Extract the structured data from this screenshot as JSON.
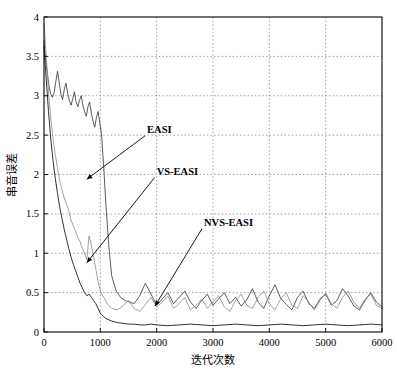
{
  "chart_data": {
    "type": "line",
    "title": "",
    "xlabel": "迭代次数",
    "ylabel": "串音误差",
    "xlim": [
      0,
      6000
    ],
    "ylim": [
      0,
      4
    ],
    "xticks": [
      0,
      1000,
      2000,
      3000,
      4000,
      5000,
      6000
    ],
    "xtick_labels": [
      "0",
      "1000",
      "2000",
      "3000",
      "4000",
      "5000",
      "6000"
    ],
    "yticks": [
      0,
      0.5,
      1,
      1.5,
      2,
      2.5,
      3,
      3.5,
      4
    ],
    "ytick_labels": [
      "0",
      "0.5",
      "1",
      "1.5",
      "2",
      "2.5",
      "3",
      "3.5",
      "4"
    ],
    "grid": true,
    "grid_style": "dotted",
    "legend": "annotations",
    "colors": {
      "easi": "#333333",
      "vs_easi": "#8a8a8a",
      "nvs_easi": "#1a1a1a",
      "grid": "#8a8a8a",
      "axis": "#000000"
    },
    "annotations": [
      {
        "label": "EASI",
        "text_x": 1830,
        "text_y": 2.53,
        "arrow_to_x": 760,
        "arrow_to_y": 1.94
      },
      {
        "label": "VS-EASI",
        "text_x": 2000,
        "text_y": 2.0,
        "arrow_to_x": 760,
        "arrow_to_y": 0.88
      },
      {
        "label": "NVS-EASI",
        "text_x": 2840,
        "text_y": 1.35,
        "arrow_to_x": 1970,
        "arrow_to_y": 0.33
      }
    ],
    "series": [
      {
        "name": "EASI",
        "color": "#333333",
        "description": "Noisy high-variance trace; starts near 3.7, oscillates around 3.0 until ~1000 iterations, then drops sharply and fluctuates around 0.3-0.5 thereafter.",
        "x": [
          0,
          30,
          60,
          90,
          120,
          150,
          180,
          210,
          240,
          270,
          300,
          330,
          360,
          390,
          420,
          450,
          480,
          510,
          540,
          570,
          600,
          630,
          660,
          690,
          720,
          750,
          780,
          810,
          840,
          870,
          900,
          930,
          960,
          990,
          1020,
          1060,
          1100,
          1150,
          1200,
          1280,
          1360,
          1440,
          1520,
          1600,
          1700,
          1800,
          1900,
          2000,
          2100,
          2200,
          2300,
          2400,
          2500,
          2600,
          2700,
          2800,
          2900,
          3000,
          3100,
          3200,
          3300,
          3400,
          3500,
          3600,
          3700,
          3800,
          3900,
          4000,
          4100,
          4200,
          4300,
          4400,
          4500,
          4600,
          4700,
          4800,
          4900,
          5000,
          5100,
          5200,
          5300,
          5400,
          5500,
          5600,
          5700,
          5800,
          5900,
          6000
        ],
        "y": [
          3.7,
          3.45,
          3.28,
          3.12,
          3.02,
          2.98,
          3.04,
          3.18,
          3.31,
          3.17,
          3.02,
          2.95,
          3.08,
          3.16,
          3.03,
          2.94,
          2.88,
          2.96,
          3.05,
          2.92,
          2.86,
          2.94,
          3.0,
          2.88,
          2.8,
          2.74,
          2.86,
          2.92,
          2.78,
          2.68,
          2.6,
          2.72,
          2.8,
          2.66,
          2.52,
          2.1,
          1.6,
          1.1,
          0.72,
          0.52,
          0.44,
          0.4,
          0.38,
          0.36,
          0.46,
          0.62,
          0.48,
          0.34,
          0.42,
          0.5,
          0.36,
          0.44,
          0.52,
          0.38,
          0.3,
          0.4,
          0.48,
          0.34,
          0.42,
          0.5,
          0.36,
          0.44,
          0.33,
          0.41,
          0.55,
          0.38,
          0.3,
          0.46,
          0.6,
          0.43,
          0.35,
          0.28,
          0.44,
          0.52,
          0.36,
          0.3,
          0.42,
          0.48,
          0.34,
          0.4,
          0.55,
          0.46,
          0.33,
          0.28,
          0.4,
          0.5,
          0.38,
          0.32
        ]
      },
      {
        "name": "VS-EASI",
        "color": "#8a8a8a",
        "description": "Gray trace; descends steadily from ~3.9 reaching ~1.0 by iteration 700 and ~0.3 by 1300, then fluctuates around 0.25-0.45.",
        "x": [
          0,
          40,
          80,
          120,
          160,
          200,
          240,
          280,
          320,
          360,
          400,
          440,
          480,
          520,
          560,
          600,
          640,
          680,
          720,
          760,
          800,
          840,
          880,
          920,
          960,
          1000,
          1060,
          1120,
          1200,
          1300,
          1400,
          1500,
          1600,
          1700,
          1800,
          1900,
          2000,
          2100,
          2200,
          2300,
          2400,
          2500,
          2600,
          2700,
          2800,
          2900,
          3000,
          3100,
          3200,
          3300,
          3400,
          3500,
          3600,
          3700,
          3800,
          3900,
          4000,
          4100,
          4200,
          4300,
          4400,
          4500,
          4600,
          4700,
          4800,
          4900,
          5000,
          5100,
          5200,
          5300,
          5400,
          5500,
          5600,
          5700,
          5800,
          5900,
          6000
        ],
        "y": [
          3.92,
          3.5,
          3.05,
          2.72,
          2.45,
          2.25,
          2.08,
          1.92,
          1.8,
          1.7,
          1.62,
          1.54,
          1.42,
          1.35,
          1.28,
          1.2,
          1.15,
          1.06,
          1.0,
          0.92,
          1.22,
          1.1,
          0.95,
          0.8,
          0.65,
          0.52,
          0.44,
          0.36,
          0.3,
          0.28,
          0.33,
          0.4,
          0.3,
          0.26,
          0.35,
          0.44,
          0.32,
          0.38,
          0.46,
          0.3,
          0.36,
          0.44,
          0.28,
          0.34,
          0.42,
          0.3,
          0.38,
          0.46,
          0.32,
          0.26,
          0.4,
          0.48,
          0.34,
          0.3,
          0.44,
          0.52,
          0.36,
          0.28,
          0.42,
          0.5,
          0.34,
          0.3,
          0.46,
          0.38,
          0.28,
          0.4,
          0.5,
          0.36,
          0.3,
          0.44,
          0.52,
          0.38,
          0.3,
          0.42,
          0.48,
          0.34,
          0.3
        ]
      },
      {
        "name": "NVS-EASI",
        "color": "#1a1a1a",
        "description": "Fastest converging trace; falls from ~3.6 to below 0.2 by iteration 1100 and stays flat near 0.08-0.12 for the remainder.",
        "x": [
          0,
          40,
          80,
          120,
          160,
          200,
          240,
          280,
          320,
          360,
          400,
          440,
          480,
          520,
          560,
          600,
          640,
          680,
          720,
          760,
          800,
          840,
          880,
          920,
          960,
          1000,
          1050,
          1100,
          1200,
          1300,
          1400,
          1500,
          1600,
          1700,
          1800,
          1900,
          2000,
          2200,
          2400,
          2600,
          2800,
          3000,
          3200,
          3400,
          3600,
          3800,
          4000,
          4200,
          4400,
          4600,
          4800,
          5000,
          5200,
          5400,
          5600,
          5800,
          6000
        ],
        "y": [
          3.62,
          3.2,
          2.8,
          2.45,
          2.18,
          1.95,
          1.76,
          1.58,
          1.44,
          1.3,
          1.18,
          1.06,
          0.95,
          0.86,
          0.78,
          0.7,
          0.62,
          0.56,
          0.5,
          0.46,
          0.48,
          0.44,
          0.4,
          0.36,
          0.3,
          0.24,
          0.2,
          0.17,
          0.14,
          0.12,
          0.11,
          0.1,
          0.1,
          0.09,
          0.09,
          0.1,
          0.09,
          0.08,
          0.09,
          0.1,
          0.09,
          0.08,
          0.09,
          0.1,
          0.09,
          0.08,
          0.09,
          0.1,
          0.09,
          0.08,
          0.09,
          0.1,
          0.09,
          0.08,
          0.09,
          0.1,
          0.09
        ]
      }
    ]
  }
}
